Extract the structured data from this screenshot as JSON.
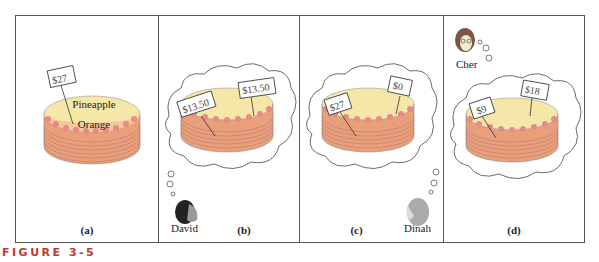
{
  "figure": {
    "caption": "FIGURE 3-5",
    "caption_color": "#c0392b"
  },
  "colors": {
    "cake_top": "#f4e7a8",
    "cake_side": "#f2b48a",
    "cake_orange_half": "#f5c89a",
    "frosting": "#e8898a",
    "cloud_stroke": "#555555"
  },
  "panels": [
    {
      "label": "(a)",
      "price_tags": [
        "$27"
      ],
      "flavors": [
        "Pineapple",
        "Orange"
      ],
      "person": null
    },
    {
      "label": "(b)",
      "price_tags": [
        "$13.50",
        "$13.50"
      ],
      "person": {
        "name": "David"
      }
    },
    {
      "label": "(c)",
      "price_tags": [
        "$27",
        "$0"
      ],
      "person": {
        "name": "Dinah"
      }
    },
    {
      "label": "(d)",
      "price_tags": [
        "$9",
        "$18"
      ],
      "person": {
        "name": "Cher"
      }
    }
  ]
}
